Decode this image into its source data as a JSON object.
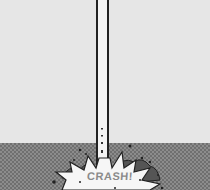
{
  "scene": {
    "description": "Comic panel: a long pole plunges into the ground producing an impact burst",
    "sound_effect": "CRASH!",
    "colors": {
      "sky": "#e6e6e6",
      "ground": "#8c8c8c",
      "outline": "#222222"
    }
  }
}
